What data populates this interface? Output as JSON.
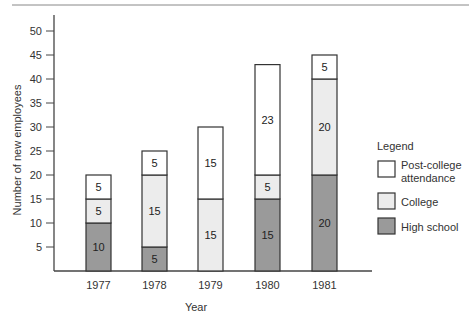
{
  "chart_data": {
    "type": "bar",
    "stacked": true,
    "title": "",
    "xlabel": "Year",
    "ylabel": "Number of new employees",
    "ylim": [
      0,
      50
    ],
    "yticks": [
      5,
      10,
      15,
      20,
      25,
      30,
      35,
      40,
      45,
      50
    ],
    "categories": [
      "1977",
      "1978",
      "1979",
      "1980",
      "1981"
    ],
    "series": [
      {
        "name": "High school",
        "color": "#9a9a9a",
        "values": [
          10,
          5,
          0,
          15,
          20
        ]
      },
      {
        "name": "College",
        "color": "#ececec",
        "values": [
          5,
          15,
          15,
          5,
          20
        ]
      },
      {
        "name": "Post-college attendance",
        "color": "#ffffff",
        "values": [
          5,
          5,
          15,
          23,
          5
        ]
      }
    ],
    "totals": [
      20,
      25,
      30,
      43,
      45
    ],
    "legend": {
      "title": "Legend",
      "position": "right",
      "entries": [
        "Post-college attendance",
        "College",
        "High school"
      ]
    },
    "grid": false
  }
}
